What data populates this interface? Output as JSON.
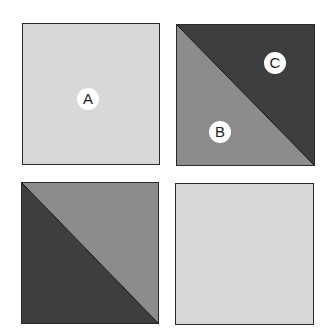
{
  "colors": {
    "light": "#d8d8d8",
    "medium": "#8c8c8c",
    "dark": "#3e3e3e",
    "border": "#2a2a2a"
  },
  "squares": [
    {
      "position": "top-left",
      "fill": "light",
      "labels": [
        {
          "text": "A"
        }
      ]
    },
    {
      "position": "top-right",
      "split": "diagonal",
      "lower_left": "medium",
      "upper_right": "dark",
      "labels": [
        {
          "text": "B"
        },
        {
          "text": "C"
        }
      ]
    },
    {
      "position": "bottom-left",
      "split": "diagonal",
      "lower_left": "dark",
      "upper_right": "medium",
      "labels": []
    },
    {
      "position": "bottom-right",
      "fill": "light",
      "labels": []
    }
  ]
}
